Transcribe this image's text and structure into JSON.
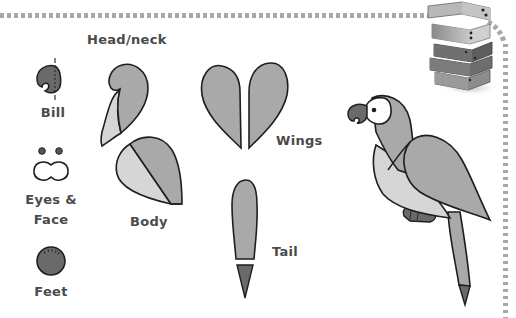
{
  "page": {
    "theme": "parrot craft template",
    "colors": {
      "background": "#ffffff",
      "border_dash": "#a8a8a8",
      "outline": "#1e1e1e",
      "dark_fill": "#6a6a6a",
      "mid_fill": "#a9a9a9",
      "light_fill": "#d6d6d6",
      "label_text": "#4a4a4a"
    }
  },
  "pieces": [
    {
      "id": "bill",
      "label": "Bill"
    },
    {
      "id": "eyes_face",
      "label_line1": "Eyes &",
      "label_line2": "Face"
    },
    {
      "id": "feet",
      "label": "Feet"
    },
    {
      "id": "head_neck",
      "label": "Head/neck"
    },
    {
      "id": "body",
      "label": "Body"
    },
    {
      "id": "wings",
      "label": "Wings"
    },
    {
      "id": "tail",
      "label": "Tail"
    }
  ],
  "illustrations": {
    "assembled": "assembled-parrot",
    "corner": "stack-of-books"
  }
}
